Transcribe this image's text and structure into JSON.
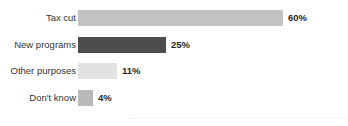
{
  "chart_data": {
    "type": "bar",
    "orientation": "horizontal",
    "title": "",
    "xlabel": "",
    "ylabel": "",
    "categories": [
      "Tax cut",
      "New programs",
      "Other purposes",
      "Don't know"
    ],
    "values": [
      60,
      25,
      11,
      4
    ],
    "value_labels": [
      "60%",
      "25%",
      "11%",
      "4%"
    ],
    "bar_colors": [
      "#c2c2c2",
      "#4d4d4d",
      "#e2e2e2",
      "#bababa"
    ],
    "xlim": [
      0,
      79
    ],
    "grid": false,
    "legend": null,
    "value_label_format": "percent",
    "background_color": "#ffffff",
    "label_color": "#333333",
    "value_color": "#262626"
  },
  "chart": {
    "background_color": "#ffffff",
    "bars": [
      {
        "category": "Tax cut",
        "value": 60,
        "value_label": "60%",
        "color": "#c2c2c2",
        "bar_px": 205,
        "top_px": 10
      },
      {
        "category": "New programs",
        "value": 25,
        "value_label": "25%",
        "color": "#4d4d4d",
        "bar_px": 88,
        "top_px": 37
      },
      {
        "category": "Other purposes",
        "value": 11,
        "value_label": "11%",
        "color": "#e2e2e2",
        "bar_px": 39,
        "top_px": 63
      },
      {
        "category": "Don't know",
        "value": 4,
        "value_label": "4%",
        "color": "#bababa",
        "bar_px": 15,
        "top_px": 90
      }
    ]
  },
  "artifacts": {
    "top_clipped_text": "",
    "ghost_text": ""
  }
}
